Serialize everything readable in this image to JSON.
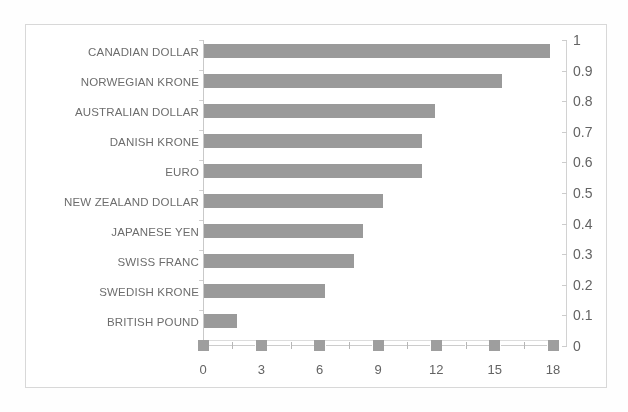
{
  "chart_data": {
    "type": "bar",
    "orientation": "horizontal",
    "title": "",
    "subtitle": "",
    "xlabel": "",
    "ylabel": "",
    "categories": [
      "CANADIAN DOLLAR",
      "NORWEGIAN KRONE",
      "AUSTRALIAN DOLLAR",
      "DANISH KRONE",
      "EURO",
      "NEW ZEALAND DOLLAR",
      "JAPANESE YEN",
      "SWISS FRANC",
      "SWEDISH KRONE",
      "BRITISH POUND"
    ],
    "values": [
      17.8,
      15.3,
      11.9,
      11.2,
      11.2,
      9.2,
      8.2,
      7.7,
      6.2,
      1.7
    ],
    "series": [
      {
        "name": "bars",
        "axis": "bottom",
        "values": [
          17.8,
          15.3,
          11.9,
          11.2,
          11.2,
          9.2,
          8.2,
          7.7,
          6.2,
          1.7
        ]
      },
      {
        "name": "markers",
        "axis": "right",
        "marker": "square",
        "x": [
          0,
          3,
          6,
          9,
          12,
          15,
          18
        ],
        "values": [
          0,
          0,
          0,
          0,
          0,
          0,
          0
        ]
      }
    ],
    "x_axis": {
      "position": "bottom",
      "ticks": [
        "0",
        "3",
        "6",
        "9",
        "12",
        "15",
        "18"
      ],
      "tick_values": [
        0,
        3,
        6,
        9,
        12,
        15,
        18
      ],
      "xlim": [
        0,
        18
      ]
    },
    "secondary_y_axis": {
      "position": "right",
      "ticks": [
        "1",
        "0.9",
        "0.8",
        "0.7",
        "0.6",
        "0.5",
        "0.4",
        "0.3",
        "0.2",
        "0.1",
        "0"
      ],
      "tick_values": [
        1,
        0.9,
        0.8,
        0.7,
        0.6,
        0.5,
        0.4,
        0.3,
        0.2,
        0.1,
        0
      ],
      "ylim": [
        0,
        1
      ]
    },
    "grid": false,
    "legend": "none",
    "colors": {
      "bar": "#9a9a9a",
      "marker": "#9e9e9e",
      "axis_line": "#cccccc",
      "text": "#636363",
      "frame": "#d8d8d8",
      "background": "#ffffff"
    }
  }
}
